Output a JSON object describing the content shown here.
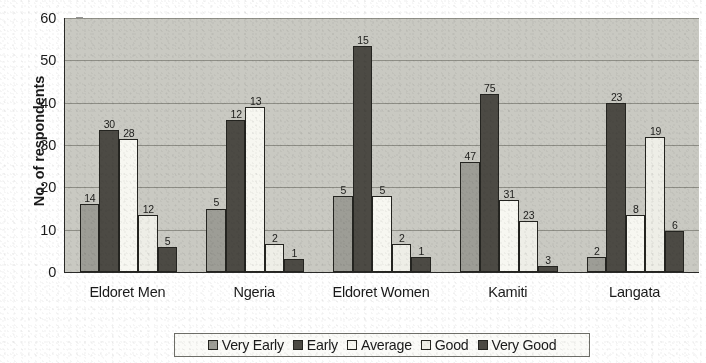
{
  "chart_data": {
    "type": "bar",
    "title": "",
    "xlabel": "",
    "ylabel": "No. of respondents",
    "ylim": [
      0,
      60
    ],
    "ytick_step": 10,
    "ytick_labels": [
      "0",
      "10",
      "20",
      "30",
      "40",
      "50",
      "60"
    ],
    "grid": true,
    "legend_position": "bottom",
    "categories": [
      "Eldoret Men",
      "Ngeria",
      "Eldoret Women",
      "Kamiti",
      "Langata"
    ],
    "series": [
      {
        "name": "Very Early",
        "color": "#9d9d96",
        "values": [
          16,
          15,
          18,
          26,
          3.5
        ],
        "labels": [
          "14",
          "5",
          "5",
          "47",
          "2"
        ]
      },
      {
        "name": "Early",
        "color": "#4c4a44",
        "values": [
          33.5,
          36,
          53.5,
          42,
          40
        ],
        "labels": [
          "30",
          "12",
          "15",
          "75",
          "23"
        ]
      },
      {
        "name": "Average",
        "color": "#f7f7f1",
        "values": [
          31.5,
          39,
          18,
          17,
          13.5
        ],
        "labels": [
          "28",
          "13",
          "5",
          "31",
          "8"
        ]
      },
      {
        "name": "Good",
        "color": "#eeeee7",
        "values": [
          13.5,
          6.5,
          6.5,
          12,
          32
        ],
        "labels": [
          "12",
          "2",
          "2",
          "23",
          "19"
        ]
      },
      {
        "name": "Very Good",
        "color": "#4c4a44",
        "values": [
          5.8,
          3,
          3.5,
          1.5,
          9.8
        ],
        "labels": [
          "5",
          "1",
          "1",
          "3",
          "6"
        ]
      }
    ]
  },
  "colors": {
    "plot_background": "#c9c9c2",
    "gridline": "#8e8e86",
    "axis": "#2a2a28",
    "bar_outline": "#242420",
    "page_background": "#ffffff"
  }
}
